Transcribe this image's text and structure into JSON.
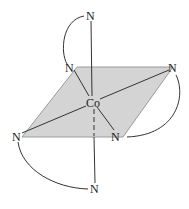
{
  "diagram": {
    "type": "octahedral coordination complex",
    "metal": {
      "label": "Co",
      "x": 93,
      "y": 106
    },
    "ligands": [
      {
        "id": "n-top",
        "label": "N",
        "x": 90,
        "y": 19
      },
      {
        "id": "n-upper-left",
        "label": "N",
        "x": 70,
        "y": 72
      },
      {
        "id": "n-upper-right",
        "label": "N",
        "x": 173,
        "y": 72
      },
      {
        "id": "n-lower-left",
        "label": "N",
        "x": 17,
        "y": 140
      },
      {
        "id": "n-lower-right",
        "label": "N",
        "x": 116,
        "y": 141
      },
      {
        "id": "n-bottom",
        "label": "N",
        "x": 95,
        "y": 193
      }
    ],
    "plane_color": "#d4d4d4",
    "line_color": "#333333"
  }
}
